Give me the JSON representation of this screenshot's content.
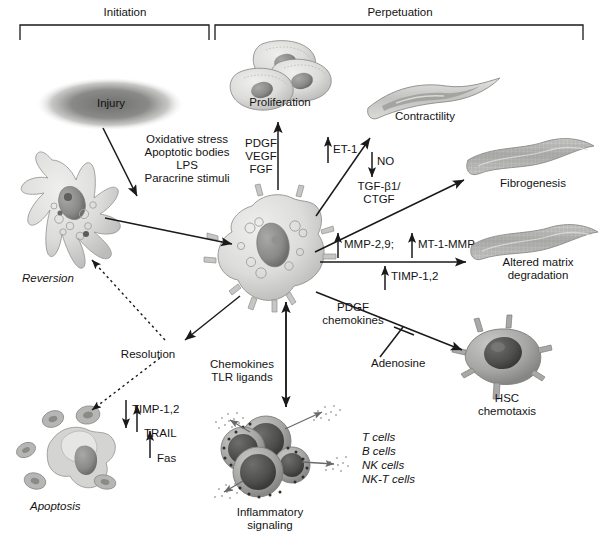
{
  "figure": {
    "phases": [
      {
        "id": "initiation",
        "label": "Initiation"
      },
      {
        "id": "perpetuation",
        "label": "Perpetuation"
      }
    ]
  },
  "nodes": {
    "injury": "Injury",
    "proliferation": "Proliferation",
    "contractility": "Contractility",
    "fibrogenesis": "Fibrogenesis",
    "altered_matrix": "Altered matrix\ndegradation",
    "hsc_chemotaxis": "HSC\nchemotaxis",
    "inflammatory": "Inflammatory\nsignaling",
    "apoptosis": "Apoptosis",
    "reversion": "Reversion",
    "resolution": "Resolution"
  },
  "mediators": {
    "injury_stimuli": "Oxidative stress\nApoptotic bodies\nLPS\nParacrine stimuli",
    "proliferation_factors": "PDGF\nVEGF\nFGF",
    "et1": "ET-1",
    "no": "NO",
    "tgf_ctgf": "TGF-β1/\nCTGF",
    "mmp": "MMP-2,9;",
    "mt1_mmp": "MT-1-MMP",
    "timp12_matrix": "TIMP-1,2",
    "pdgf_chemokines": "PDGF\nchemokines",
    "adenosine": "Adenosine",
    "chemokines_tlr": "Chemokines\nTLR ligands",
    "timp12_apop": "TIMP-1,2",
    "trail": "TRAIL",
    "fas": "Fas"
  },
  "immune_cells": {
    "list": "T cells\nB cells\nNK cells\nNK-T cells"
  },
  "colors": {
    "stroke": "#1a1a1a",
    "cell_fill_light": "#d8d8d6",
    "cell_fill_mid": "#b8b8b6",
    "cell_fill_dark": "#8c8c8a",
    "nucleus": "#7a7a78",
    "matrix": "#b5b5b3",
    "immune_dark": "#5d5d5b"
  }
}
